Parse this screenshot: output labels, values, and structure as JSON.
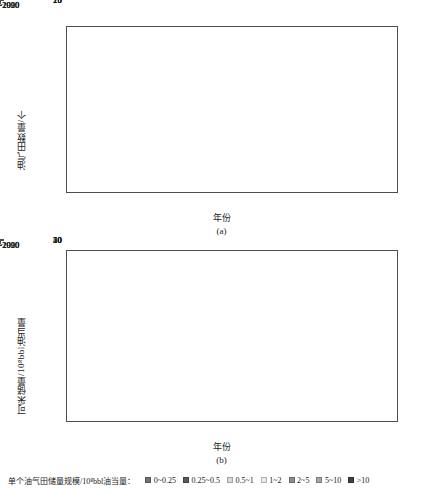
{
  "figure": {
    "panel_a_caption": "(a)",
    "panel_b_caption": "(b)"
  },
  "legend": {
    "title": "单个油气田储量规模/10⁸bbl油当量：",
    "items": [
      {
        "label": "0~0.25",
        "color": "#737373"
      },
      {
        "label": "0.25~0.5",
        "color": "#595959"
      },
      {
        "label": "0.5~1",
        "color": "#d9d9d9"
      },
      {
        "label": "1~2",
        "color": "#ededed"
      },
      {
        "label": "2~5",
        "color": "#8c8c8c"
      },
      {
        "label": "5~10",
        "color": "#a6a6a6"
      },
      {
        "label": ">10",
        "color": "#404040"
      }
    ]
  },
  "chart_data": [
    {
      "type": "bar",
      "stacked": true,
      "panel": "(a)",
      "title": "",
      "xlabel": "年份",
      "ylabel": "油气田数量/个",
      "categories": [
        "1981~1990",
        "1991~2000",
        "2001~2010",
        "2011~2020"
      ],
      "ylim": [
        0,
        25
      ],
      "yticks": [
        0,
        5,
        10,
        15,
        20,
        25
      ],
      "grid": false,
      "legend_position": "bottom",
      "series": [
        {
          "name": "0~0.25",
          "color": "#737373",
          "values": [
            2,
            1,
            3,
            3
          ]
        },
        {
          "name": "0.25~0.5",
          "color": "#595959",
          "values": [
            0,
            1,
            0,
            0
          ]
        },
        {
          "name": "0.5~1",
          "color": "#d9d9d9",
          "values": [
            0,
            2,
            0,
            2
          ]
        },
        {
          "name": "1~2",
          "color": "#ededed",
          "values": [
            0,
            0,
            0,
            8
          ]
        },
        {
          "name": "2~5",
          "color": "#8c8c8c",
          "values": [
            0,
            1,
            2,
            3
          ]
        },
        {
          "name": "5~10",
          "color": "#a6a6a6",
          "values": [
            0,
            0,
            1,
            6
          ]
        },
        {
          "name": ">10",
          "color": "#404040",
          "values": [
            0,
            1,
            0,
            0
          ]
        }
      ],
      "totals": [
        2,
        6,
        6,
        22
      ]
    },
    {
      "type": "bar",
      "stacked": true,
      "panel": "(b)",
      "title": "",
      "xlabel": "年份",
      "ylabel": "可采储量/10⁸bbl油当量",
      "categories": [
        "1981~1990",
        "1991~2000",
        "2001~2010",
        "2011~2020"
      ],
      "ylim": [
        0,
        50
      ],
      "yticks": [
        0,
        10,
        20,
        30,
        40,
        50
      ],
      "grid": false,
      "legend_position": "bottom",
      "series": [
        {
          "name": "0~0.25",
          "color": "#737373",
          "values": [
            0.2,
            0.3,
            0.4,
            0.6
          ]
        },
        {
          "name": "0.25~0.5",
          "color": "#595959",
          "values": [
            0,
            0.4,
            0,
            0
          ]
        },
        {
          "name": "0.5~1",
          "color": "#d9d9d9",
          "values": [
            0,
            1.1,
            0,
            1.4
          ]
        },
        {
          "name": "1~2",
          "color": "#ededed",
          "values": [
            0,
            0,
            0,
            13.0
          ]
        },
        {
          "name": "2~5",
          "color": "#8c8c8c",
          "values": [
            0,
            3.7,
            2.1,
            9.0
          ]
        },
        {
          "name": "5~10",
          "color": "#a6a6a6",
          "values": [
            0,
            0,
            0,
            19.0
          ]
        },
        {
          "name": ">10",
          "color": "#404040",
          "values": [
            0,
            10.5,
            0,
            0
          ]
        }
      ],
      "totals": [
        0.2,
        16,
        2.5,
        43
      ]
    }
  ]
}
